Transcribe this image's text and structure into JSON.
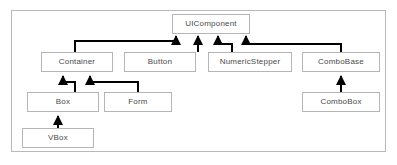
{
  "diagram": {
    "type": "uml-class-inheritance",
    "title": "",
    "frame": {
      "x": 11,
      "y": 10,
      "width": 375,
      "height": 142,
      "border_color": "#b9b9b9"
    },
    "style": {
      "box_border_color": "#b5b5b5",
      "box_fill": "#ffffff",
      "text_color": "#4a4a4a",
      "edge_color": "#000000",
      "background": "#ffffff"
    },
    "nodes": [
      {
        "id": "uicomponent",
        "label": "UIComponent",
        "x": 172,
        "y": 14,
        "width": 78,
        "height": 20
      },
      {
        "id": "container",
        "label": "Container",
        "x": 41,
        "y": 52,
        "width": 72,
        "height": 20
      },
      {
        "id": "button",
        "label": "Button",
        "x": 124,
        "y": 52,
        "width": 72,
        "height": 20
      },
      {
        "id": "numericstepper",
        "label": "NumericStepper",
        "x": 208,
        "y": 52,
        "width": 84,
        "height": 20
      },
      {
        "id": "combobase",
        "label": "ComboBase",
        "x": 302,
        "y": 52,
        "width": 78,
        "height": 20
      },
      {
        "id": "box",
        "label": "Box",
        "x": 27,
        "y": 92,
        "width": 72,
        "height": 20
      },
      {
        "id": "form",
        "label": "Form",
        "x": 104,
        "y": 92,
        "width": 68,
        "height": 20
      },
      {
        "id": "combobox",
        "label": "ComboBox",
        "x": 302,
        "y": 92,
        "width": 78,
        "height": 20
      },
      {
        "id": "vbox",
        "label": "VBox",
        "x": 22,
        "y": 128,
        "width": 72,
        "height": 20
      }
    ],
    "edges": [
      {
        "from": "container",
        "to": "uicomponent",
        "relation": "generalization"
      },
      {
        "from": "button",
        "to": "uicomponent",
        "relation": "generalization"
      },
      {
        "from": "numericstepper",
        "to": "uicomponent",
        "relation": "generalization"
      },
      {
        "from": "combobase",
        "to": "uicomponent",
        "relation": "generalization"
      },
      {
        "from": "box",
        "to": "container",
        "relation": "generalization"
      },
      {
        "from": "form",
        "to": "container",
        "relation": "generalization"
      },
      {
        "from": "vbox",
        "to": "box",
        "relation": "generalization"
      },
      {
        "from": "combobox",
        "to": "combobase",
        "relation": "generalization"
      }
    ]
  }
}
